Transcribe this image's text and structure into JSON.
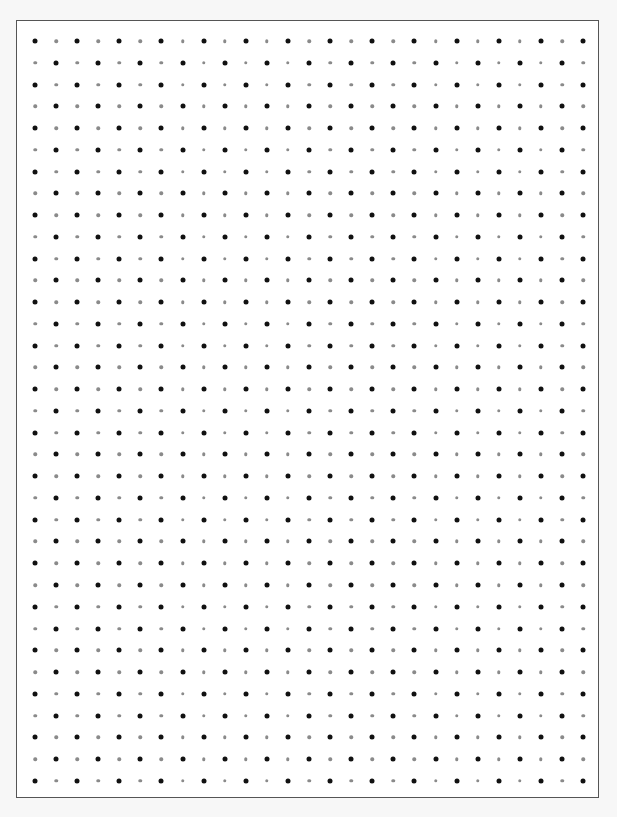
{
  "sheet": {
    "type": "dot-grid-paper",
    "columns": 27,
    "rows": 35,
    "origin_x": 34,
    "origin_y": 40,
    "spacing_x": 21.08,
    "spacing_y": 21.76,
    "pattern": "checkerboard",
    "first_dot": "dark",
    "dark_dot": {
      "color": "#111111",
      "diameter": 5
    },
    "light_dot": {
      "color": "#8a8a8a",
      "diameter": 3.5
    },
    "border_color": "#555555",
    "background": "#ffffff"
  }
}
